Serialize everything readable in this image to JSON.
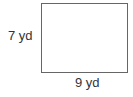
{
  "diagram": {
    "shape": "rectangle",
    "height_label": "7 yd",
    "width_label": "9 yd",
    "stroke_color": "#666666",
    "text_color": "#333333"
  }
}
